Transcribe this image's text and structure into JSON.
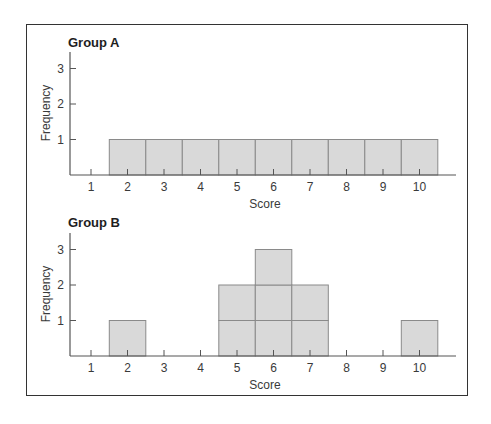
{
  "chart_data": [
    {
      "type": "bar",
      "title": "Group A",
      "xlabel": "Score",
      "ylabel": "Frequency",
      "categories": [
        "1",
        "2",
        "3",
        "4",
        "5",
        "6",
        "7",
        "8",
        "9",
        "10"
      ],
      "values": [
        0,
        1,
        1,
        1,
        1,
        1,
        1,
        1,
        1,
        1
      ],
      "yticks": [
        "1",
        "2",
        "3"
      ],
      "ylim": [
        0,
        3.5
      ],
      "grid": false,
      "legend": null,
      "style": "stacked unit boxes (histogram)"
    },
    {
      "type": "bar",
      "title": "Group B",
      "xlabel": "Score",
      "ylabel": "Frequency",
      "categories": [
        "1",
        "2",
        "3",
        "4",
        "5",
        "6",
        "7",
        "8",
        "9",
        "10"
      ],
      "values": [
        0,
        1,
        0,
        0,
        2,
        3,
        2,
        0,
        0,
        1
      ],
      "yticks": [
        "1",
        "2",
        "3"
      ],
      "ylim": [
        0,
        3.5
      ],
      "grid": false,
      "legend": null,
      "style": "stacked unit boxes (histogram)"
    }
  ],
  "colors": {
    "bar_fill": "#d9d9d9",
    "bar_stroke": "#8a8a8a",
    "axis": "#555555",
    "frame": "#333333"
  }
}
